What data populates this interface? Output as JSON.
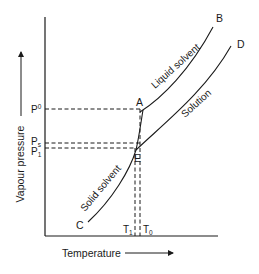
{
  "diagram": {
    "type": "phase-diagram",
    "axes": {
      "x_label": "Temperature",
      "y_label": "Vapour pressure"
    },
    "pressure_labels": {
      "p0": "P",
      "p0_sup": "0",
      "ps": "P",
      "ps_sub": "s",
      "p1": "P",
      "p1_sub": "1"
    },
    "temperature_labels": {
      "t1": "T",
      "t1_sub": "1",
      "t0": "T",
      "t0_sub": "0"
    },
    "points": {
      "A": "A",
      "B": "B",
      "C": "C",
      "D": "D",
      "E": "E"
    },
    "curves": {
      "liquid": "Liquid solvent",
      "solution": "Solution",
      "solid": "Solid solvent"
    },
    "colors": {
      "ink": "#1a1a1a",
      "background": "#ffffff"
    }
  }
}
